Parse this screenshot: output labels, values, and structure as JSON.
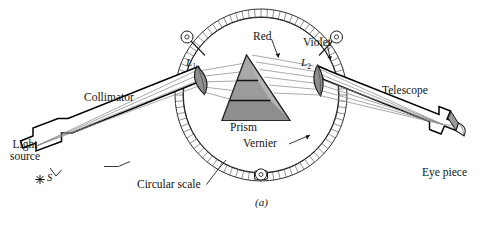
{
  "figure": {
    "kind": "optics-diagram",
    "caption": "(a)"
  },
  "labels": {
    "collimator": "Collimator",
    "light_source_line1": "Light",
    "light_source_line2": "source",
    "slit_symbol": "S",
    "star_symbol": "✳",
    "lens1": "L",
    "lens1_sub": "1",
    "lens2": "L",
    "lens2_sub": "2",
    "red": "Red",
    "violet": "Violet",
    "prism": "Prism",
    "vernier": "Vernier",
    "circular_scale": "Circular scale",
    "telescope": "Telescope",
    "eye_piece": "Eye piece"
  },
  "components": [
    {
      "name": "light-source",
      "label": "Light source"
    },
    {
      "name": "slit",
      "label": "S"
    },
    {
      "name": "collimator-tube",
      "label": "Collimator"
    },
    {
      "name": "collimator-lens",
      "label": "L1"
    },
    {
      "name": "prism",
      "label": "Prism"
    },
    {
      "name": "telescope-objective-lens",
      "label": "L2"
    },
    {
      "name": "telescope-tube",
      "label": "Telescope"
    },
    {
      "name": "eye-piece",
      "label": "Eye piece"
    },
    {
      "name": "circular-scale",
      "label": "Circular scale"
    },
    {
      "name": "vernier",
      "label": "Vernier"
    },
    {
      "name": "clamp-screw-left",
      "label": ""
    },
    {
      "name": "clamp-screw-right",
      "label": ""
    },
    {
      "name": "clamp-screw-bottom",
      "label": ""
    }
  ],
  "rays": {
    "red_label": "Red",
    "violet_label": "Violet",
    "incident_count": 4,
    "dispersed_count": 5
  },
  "colors": {
    "ink": "#141414",
    "outline": "#000000",
    "prism_band_light": "#b9b9b9",
    "prism_band_mid": "#9f9f9f",
    "prism_band_dark": "#8d8d8d",
    "lens_fill": "#8e8e8e",
    "tube_fill": "#ffffff",
    "ray_gray": "#8d8d8d",
    "scale_fill": "#fbfbfb",
    "background": "#ffffff"
  },
  "scale": {
    "center_x": 261,
    "center_y": 95,
    "radius_outer": 86,
    "radius_inner": 78,
    "tick_count": 84
  }
}
